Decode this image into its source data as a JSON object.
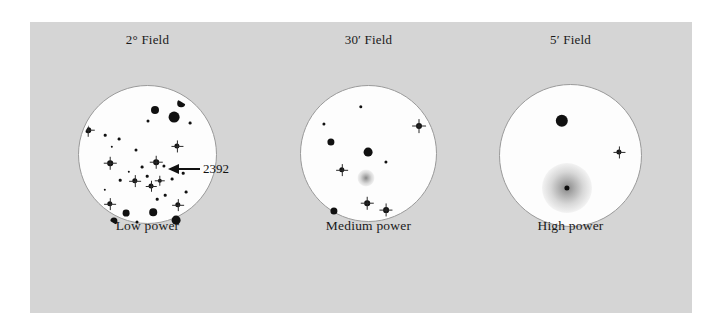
{
  "figure": {
    "subject": "2392",
    "panel_color": "#d5d5d5",
    "page_color": "#ffffff",
    "circle_fill": "#fdfdfd",
    "circle_stroke": "#9a9a9a",
    "star_color": "#111111",
    "nebula_color": "#787878"
  },
  "annotation": {
    "label": "2392"
  },
  "views": [
    {
      "id": "low-power",
      "title": "2° Field",
      "caption": "Low power",
      "center_x": 147,
      "center_y": 162,
      "diameter": 139,
      "stars": [
        {
          "x": 101,
          "y": 96,
          "r": 2.6,
          "spiky": true
        },
        {
          "x": 126,
          "y": 89,
          "r": 2.4,
          "spiky": true
        },
        {
          "x": 155,
          "y": 110,
          "r": 4.0,
          "spiky": false
        },
        {
          "x": 181,
          "y": 103,
          "r": 3.8,
          "spiky": false
        },
        {
          "x": 174,
          "y": 117,
          "r": 5.4,
          "spiky": false
        },
        {
          "x": 190,
          "y": 123,
          "r": 1.4,
          "spiky": false
        },
        {
          "x": 148,
          "y": 121,
          "r": 1.5,
          "spiky": false
        },
        {
          "x": 88,
          "y": 130,
          "r": 2.8,
          "spiky": true
        },
        {
          "x": 105,
          "y": 135,
          "r": 1.3,
          "spiky": false
        },
        {
          "x": 119,
          "y": 139,
          "r": 1.4,
          "spiky": false
        },
        {
          "x": 112,
          "y": 147,
          "r": 1.2,
          "spiky": false
        },
        {
          "x": 136,
          "y": 150,
          "r": 1.5,
          "spiky": false
        },
        {
          "x": 177,
          "y": 146,
          "r": 2.6,
          "spiky": true
        },
        {
          "x": 110,
          "y": 163,
          "r": 2.8,
          "spiky": true
        },
        {
          "x": 156,
          "y": 162,
          "r": 2.8,
          "spiky": true
        },
        {
          "x": 142,
          "y": 167,
          "r": 1.4,
          "spiky": false
        },
        {
          "x": 164,
          "y": 166,
          "r": 1.6,
          "spiky": false
        },
        {
          "x": 129,
          "y": 172,
          "r": 1.2,
          "spiky": false
        },
        {
          "x": 147,
          "y": 176,
          "r": 1.3,
          "spiky": false
        },
        {
          "x": 120,
          "y": 180,
          "r": 1.3,
          "spiky": false
        },
        {
          "x": 135,
          "y": 181,
          "r": 2.7,
          "spiky": true
        },
        {
          "x": 151,
          "y": 186,
          "r": 2.5,
          "spiky": true
        },
        {
          "x": 160,
          "y": 181,
          "r": 2.2,
          "spiky": true
        },
        {
          "x": 172,
          "y": 179,
          "r": 1.4,
          "spiky": false
        },
        {
          "x": 183,
          "y": 173,
          "r": 1.3,
          "spiky": false
        },
        {
          "x": 105,
          "y": 190,
          "r": 1.2,
          "spiky": false
        },
        {
          "x": 165,
          "y": 195,
          "r": 1.3,
          "spiky": false
        },
        {
          "x": 186,
          "y": 192,
          "r": 1.4,
          "spiky": false
        },
        {
          "x": 110,
          "y": 204,
          "r": 2.7,
          "spiky": true
        },
        {
          "x": 178,
          "y": 205,
          "r": 2.7,
          "spiky": true
        },
        {
          "x": 126,
          "y": 213,
          "r": 3.4,
          "spiky": false
        },
        {
          "x": 153,
          "y": 212,
          "r": 3.8,
          "spiky": false
        },
        {
          "x": 114,
          "y": 221,
          "r": 3.6,
          "spiky": false
        },
        {
          "x": 137,
          "y": 222,
          "r": 1.5,
          "spiky": false
        },
        {
          "x": 176,
          "y": 220,
          "r": 4.4,
          "spiky": false
        },
        {
          "x": 157,
          "y": 199,
          "r": 1.3,
          "spiky": false
        }
      ],
      "nebulae": [],
      "annotation": {
        "tip_x": 168,
        "tip_y": 169,
        "line_end_x": 200,
        "label_x": 203
      }
    },
    {
      "id": "medium-power",
      "title": "30′ Field",
      "caption": "Medium power",
      "center_x": 368,
      "center_y": 162,
      "diameter": 137,
      "stars": [
        {
          "x": 361,
          "y": 107,
          "r": 1.7,
          "spiky": false
        },
        {
          "x": 324,
          "y": 124,
          "r": 1.6,
          "spiky": false
        },
        {
          "x": 419,
          "y": 126,
          "r": 3.0,
          "spiky": true
        },
        {
          "x": 331,
          "y": 142,
          "r": 3.6,
          "spiky": false
        },
        {
          "x": 368,
          "y": 152,
          "r": 4.4,
          "spiky": false
        },
        {
          "x": 386,
          "y": 162,
          "r": 1.6,
          "spiky": false
        },
        {
          "x": 342,
          "y": 170,
          "r": 2.7,
          "spiky": true
        },
        {
          "x": 367,
          "y": 203,
          "r": 2.8,
          "spiky": true
        },
        {
          "x": 334,
          "y": 211,
          "r": 3.6,
          "spiky": false
        },
        {
          "x": 386,
          "y": 210,
          "r": 2.9,
          "spiky": true
        }
      ],
      "nebulae": [
        {
          "x": 366,
          "y": 178,
          "size": 17,
          "core": 0
        }
      ],
      "annotation": null
    },
    {
      "id": "high-power",
      "title": "5′ Field",
      "caption": "High power",
      "center_x": 570,
      "center_y": 162,
      "diameter": 143,
      "stars": [
        {
          "x": 562,
          "y": 121,
          "r": 6.2,
          "spiky": false
        },
        {
          "x": 619,
          "y": 152,
          "r": 2.6,
          "spiky": true
        }
      ],
      "nebulae": [
        {
          "x": 567,
          "y": 188,
          "size": 50,
          "core": 2.6
        }
      ],
      "annotation": null
    }
  ]
}
